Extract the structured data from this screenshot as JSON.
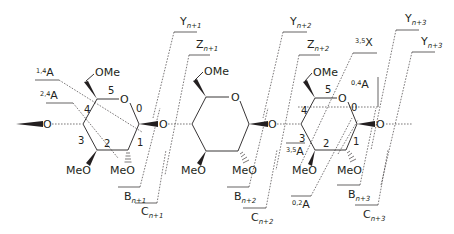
{
  "diagram": {
    "rings": [
      {
        "id": "residue-1",
        "substituent_top": "OMe",
        "substituents_bottom": [
          "MeO",
          "MeO"
        ],
        "ring_oxygen": "O",
        "atom_numbers": [
          "0",
          "1",
          "2",
          "3",
          "4",
          "5"
        ]
      },
      {
        "id": "residue-2",
        "substituent_top": "OMe",
        "substituents_bottom": [
          "MeO",
          "MeO"
        ],
        "ring_oxygen": "O"
      },
      {
        "id": "residue-3",
        "substituent_top": "OMe",
        "substituents_bottom": [
          "MeO",
          "MeO"
        ],
        "ring_oxygen": "O",
        "atom_numbers": [
          "0",
          "1",
          "2",
          "3",
          "4",
          "5"
        ]
      }
    ],
    "glycosidic_oxygens": [
      "O",
      "O",
      "O",
      "O"
    ],
    "glycosidic_cleavages": {
      "B": [
        {
          "base": "B",
          "sub": "n+1"
        },
        {
          "base": "B",
          "sub": "n+2"
        },
        {
          "base": "B",
          "sub": "n+3"
        }
      ],
      "C": [
        {
          "base": "C",
          "sub": "n+1"
        },
        {
          "base": "C",
          "sub": "n+2"
        },
        {
          "base": "C",
          "sub": "n+3"
        }
      ],
      "Y": [
        {
          "base": "Y",
          "sub": "n+1"
        },
        {
          "base": "Y",
          "sub": "n+2"
        },
        {
          "base": "Y",
          "sub": "n+3"
        }
      ],
      "Z": [
        {
          "base": "Z",
          "sub": "n+1"
        },
        {
          "base": "Z",
          "sub": "n+2"
        },
        {
          "base": "Y",
          "sub": "n+3"
        }
      ]
    },
    "cross_ring_cleavages": [
      {
        "sup": "1,4",
        "base": "A"
      },
      {
        "sup": "2,4",
        "base": "A"
      },
      {
        "sup": "3,5",
        "base": "X"
      },
      {
        "sup": "0,4",
        "base": "A"
      },
      {
        "sup": "3,5",
        "base": "A"
      },
      {
        "sup": "0,2",
        "base": "A"
      }
    ]
  }
}
